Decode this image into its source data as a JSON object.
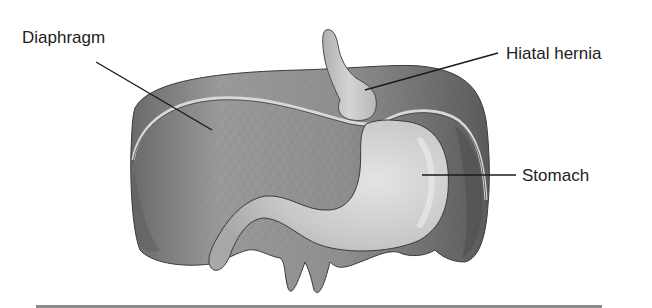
{
  "figure": {
    "type": "anatomical-illustration",
    "subject": "Hiatal hernia",
    "labels": [
      {
        "id": "diaphragm",
        "text": "Diaphragm"
      },
      {
        "id": "hiatal-hernia",
        "text": "Hiatal hernia"
      },
      {
        "id": "stomach",
        "text": "Stomach"
      }
    ]
  },
  "colors": {
    "background": "#ffffff",
    "diaphragm_light": "#a6a6a6",
    "diaphragm_dark": "#5f5f5f",
    "stomach": "#c9c9c9",
    "stomach_highlight": "#e2e2e2",
    "leader_line": "#1a1a1a",
    "text": "#222222"
  }
}
